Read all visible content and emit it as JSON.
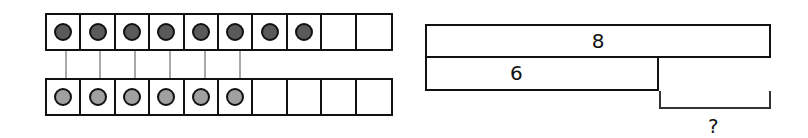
{
  "colors": {
    "line": "#111111",
    "counter_top_fill": "#5a5a5a",
    "counter_bottom_fill": "#a0a0a0",
    "connector": "#a9a9a9"
  },
  "ten_frames": [
    {
      "name": "top",
      "cells": 10,
      "filled": 8,
      "counter_color": "#5a5a5a"
    },
    {
      "name": "bottom",
      "cells": 10,
      "filled": 6,
      "counter_color": "#a0a0a0"
    }
  ],
  "connectors": 6,
  "bar_model": {
    "whole": {
      "label": "8"
    },
    "part": {
      "label": "6"
    },
    "unknown": {
      "label": "?"
    }
  }
}
